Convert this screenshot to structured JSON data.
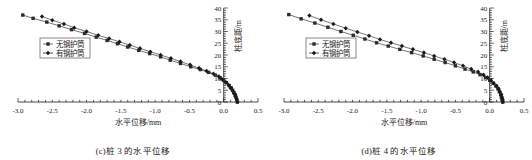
{
  "figure": {
    "panels": [
      {
        "id": "panel-c",
        "caption": "(c)桩 3 的水平位移",
        "chart_data": {
          "type": "line",
          "title": "",
          "subtitle": "",
          "xlabel": "水平位移/mm",
          "ylabel": "桩底距/m",
          "xlim": [
            -3.0,
            0.5
          ],
          "ylim": [
            0,
            40
          ],
          "xticks": [
            "-3.0",
            "-2.5",
            "-2.0",
            "-1.5",
            "-1.0",
            "-0.5",
            "0.0",
            "0.5"
          ],
          "xtick_values": [
            -3.0,
            -2.5,
            -2.0,
            -1.5,
            -1.0,
            -0.5,
            0.0,
            0.5
          ],
          "yticks": [
            "0",
            "5",
            "10",
            "15",
            "20",
            "25",
            "30",
            "35",
            "40"
          ],
          "ytick_values": [
            0,
            5,
            10,
            15,
            20,
            25,
            30,
            35,
            40
          ],
          "grid": false,
          "legend_position": "center-left",
          "series": [
            {
              "name": "无钢护筒",
              "marker": "square",
              "color": "#2b2b2b",
              "points": [
                [
                  -2.93,
                  37.0
                ],
                [
                  -2.78,
                  35.6
                ],
                [
                  -2.58,
                  34.0
                ],
                [
                  -2.4,
                  32.4
                ],
                [
                  -2.22,
                  30.8
                ],
                [
                  -2.03,
                  29.2
                ],
                [
                  -1.86,
                  27.6
                ],
                [
                  -1.7,
                  26.2
                ],
                [
                  -1.55,
                  24.8
                ],
                [
                  -1.4,
                  23.4
                ],
                [
                  -1.24,
                  22.0
                ],
                [
                  -1.08,
                  20.6
                ],
                [
                  -0.92,
                  19.2
                ],
                [
                  -0.78,
                  17.8
                ],
                [
                  -0.63,
                  16.4
                ],
                [
                  -0.48,
                  15.0
                ],
                [
                  -0.34,
                  13.8
                ],
                [
                  -0.22,
                  12.6
                ],
                [
                  -0.12,
                  11.4
                ],
                [
                  -0.05,
                  10.2
                ],
                [
                  0.0,
                  9.2
                ],
                [
                  0.04,
                  8.2
                ],
                [
                  0.08,
                  7.0
                ],
                [
                  0.11,
                  6.0
                ],
                [
                  0.13,
                  5.0
                ],
                [
                  0.15,
                  4.0
                ],
                [
                  0.17,
                  3.0
                ],
                [
                  0.18,
                  2.0
                ],
                [
                  0.19,
                  1.0
                ],
                [
                  0.2,
                  0.0
                ]
              ]
            },
            {
              "name": "有钢护筒",
              "marker": "diamond",
              "color": "#1a1a1a",
              "points": [
                [
                  -2.65,
                  36.4
                ],
                [
                  -2.5,
                  34.8
                ],
                [
                  -2.33,
                  33.2
                ],
                [
                  -2.18,
                  31.6
                ],
                [
                  -2.0,
                  30.0
                ],
                [
                  -1.83,
                  28.4
                ],
                [
                  -1.67,
                  27.0
                ],
                [
                  -1.52,
                  25.6
                ],
                [
                  -1.37,
                  24.2
                ],
                [
                  -1.22,
                  22.8
                ],
                [
                  -1.07,
                  21.4
                ],
                [
                  -0.92,
                  20.0
                ],
                [
                  -0.77,
                  18.6
                ],
                [
                  -0.63,
                  17.2
                ],
                [
                  -0.49,
                  15.8
                ],
                [
                  -0.36,
                  14.4
                ],
                [
                  -0.25,
                  13.2
                ],
                [
                  -0.15,
                  12.0
                ],
                [
                  -0.07,
                  10.8
                ],
                [
                  -0.02,
                  9.6
                ],
                [
                  0.03,
                  8.4
                ],
                [
                  0.07,
                  7.2
                ],
                [
                  0.1,
                  6.0
                ],
                [
                  0.13,
                  4.8
                ],
                [
                  0.15,
                  3.6
                ],
                [
                  0.17,
                  2.4
                ],
                [
                  0.19,
                  1.2
                ],
                [
                  0.2,
                  0.0
                ]
              ]
            }
          ]
        }
      },
      {
        "id": "panel-d",
        "caption": "(d)桩 4 的水平位移",
        "chart_data": {
          "type": "line",
          "title": "",
          "subtitle": "",
          "xlabel": "水平位移/mm",
          "ylabel": "桩底距/m",
          "xlim": [
            -3.0,
            0.5
          ],
          "ylim": [
            0,
            40
          ],
          "xticks": [
            "-3.0",
            "-2.5",
            "-2.0",
            "-1.5",
            "-1.0",
            "-0.5",
            "0.0",
            "0.5"
          ],
          "xtick_values": [
            -3.0,
            -2.5,
            -2.0,
            -1.5,
            -1.0,
            -0.5,
            0.0,
            0.5
          ],
          "yticks": [
            "0",
            "5",
            "10",
            "15",
            "20",
            "25",
            "30",
            "35",
            "40"
          ],
          "ytick_values": [
            0,
            5,
            10,
            15,
            20,
            25,
            30,
            35,
            40
          ],
          "grid": false,
          "legend_position": "center-left",
          "series": [
            {
              "name": "无钢护筒",
              "marker": "square",
              "color": "#2b2b2b",
              "points": [
                [
                  -2.93,
                  37.2
                ],
                [
                  -2.75,
                  35.4
                ],
                [
                  -2.55,
                  33.6
                ],
                [
                  -2.36,
                  31.8
                ],
                [
                  -2.17,
                  30.0
                ],
                [
                  -1.99,
                  28.4
                ],
                [
                  -1.82,
                  26.8
                ],
                [
                  -1.65,
                  25.2
                ],
                [
                  -1.48,
                  23.8
                ],
                [
                  -1.31,
                  22.4
                ],
                [
                  -1.14,
                  21.0
                ],
                [
                  -0.97,
                  19.6
                ],
                [
                  -0.81,
                  18.2
                ],
                [
                  -0.65,
                  16.8
                ],
                [
                  -0.5,
                  15.4
                ],
                [
                  -0.36,
                  14.0
                ],
                [
                  -0.24,
                  12.8
                ],
                [
                  -0.14,
                  11.6
                ],
                [
                  -0.06,
                  10.4
                ],
                [
                  0.0,
                  9.2
                ],
                [
                  0.05,
                  8.0
                ],
                [
                  0.09,
                  6.8
                ],
                [
                  0.12,
                  5.6
                ],
                [
                  0.14,
                  4.4
                ],
                [
                  0.16,
                  3.2
                ],
                [
                  0.17,
                  2.0
                ],
                [
                  0.18,
                  1.0
                ],
                [
                  0.19,
                  0.0
                ]
              ]
            },
            {
              "name": "有钢护筒",
              "marker": "diamond",
              "color": "#1a1a1a",
              "points": [
                [
                  -2.63,
                  36.8
                ],
                [
                  -2.46,
                  35.0
                ],
                [
                  -2.28,
                  33.2
                ],
                [
                  -2.1,
                  31.4
                ],
                [
                  -1.93,
                  29.8
                ],
                [
                  -1.76,
                  28.2
                ],
                [
                  -1.6,
                  26.6
                ],
                [
                  -1.44,
                  25.2
                ],
                [
                  -1.28,
                  23.8
                ],
                [
                  -1.12,
                  22.4
                ],
                [
                  -0.96,
                  21.0
                ],
                [
                  -0.81,
                  19.6
                ],
                [
                  -0.66,
                  18.2
                ],
                [
                  -0.52,
                  16.8
                ],
                [
                  -0.39,
                  15.4
                ],
                [
                  -0.27,
                  14.0
                ],
                [
                  -0.17,
                  12.8
                ],
                [
                  -0.09,
                  11.6
                ],
                [
                  -0.03,
                  10.4
                ],
                [
                  0.02,
                  9.2
                ],
                [
                  0.06,
                  8.0
                ],
                [
                  0.1,
                  6.8
                ],
                [
                  0.13,
                  5.6
                ],
                [
                  0.15,
                  4.4
                ],
                [
                  0.17,
                  3.2
                ],
                [
                  0.18,
                  2.0
                ],
                [
                  0.19,
                  1.0
                ],
                [
                  0.19,
                  0.0
                ]
              ]
            }
          ]
        }
      }
    ]
  }
}
